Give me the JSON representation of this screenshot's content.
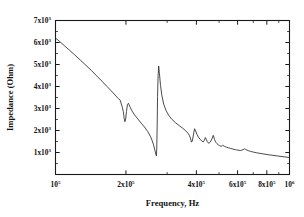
{
  "chart_data": {
    "type": "line",
    "title": "",
    "xlabel": "Frequency, Hz",
    "ylabel": "Impedance (Ohm)",
    "xscale": "log",
    "yscale": "linear",
    "xlim": [
      100000,
      1000000
    ],
    "ylim": [
      0,
      7000
    ],
    "grid": false,
    "legend": null,
    "xticks": [
      100000,
      200000,
      400000,
      600000,
      800000,
      1000000
    ],
    "xticklabels": [
      "10^5",
      "2x10^5",
      "4x10^5",
      "6x10^5",
      "8x10^5",
      "10^6"
    ],
    "yticks": [
      1000,
      2000,
      3000,
      4000,
      5000,
      6000,
      7000
    ],
    "yticklabels": [
      "1x10^3",
      "2x10^3",
      "3x10^3",
      "4x10^3",
      "5x10^3",
      "6x10^3",
      "7x10^3"
    ],
    "series": [
      {
        "name": "Impedance magnitude",
        "x": [
          100000,
          104000,
          109000,
          115000,
          121000,
          128000,
          135000,
          142000,
          150000,
          158000,
          166000,
          172000,
          178000,
          183000,
          186000,
          189000,
          191000,
          193000,
          195000,
          196500,
          198000,
          199500,
          201000,
          203000,
          205000,
          208000,
          212000,
          218000,
          225000,
          232000,
          240000,
          248000,
          256000,
          262000,
          266000,
          268500,
          270000,
          271000,
          272000,
          273000,
          274500,
          276000,
          278000,
          281000,
          285000,
          290000,
          297000,
          305000,
          315000,
          326000,
          338000,
          350000,
          360000,
          368000,
          374000,
          378000,
          381000,
          384000,
          387000,
          390000,
          393000,
          397000,
          402000,
          408000,
          415000,
          422000,
          428000,
          433000,
          437000,
          441000,
          445000,
          449000,
          453000,
          458000,
          463000,
          468000,
          472000,
          475000,
          478000,
          481000,
          485000,
          490000,
          496000,
          503000,
          510000,
          518000,
          527000,
          537000,
          548000,
          560000,
          573000,
          587000,
          602000,
          618000,
          632000,
          642000,
          650000,
          658000,
          668000,
          682000,
          700000,
          722000,
          748000,
          778000,
          812000,
          850000,
          892000,
          938000,
          1000000
        ],
        "y": [
          6200,
          6050,
          5860,
          5640,
          5430,
          5190,
          4960,
          4740,
          4480,
          4240,
          4000,
          3830,
          3660,
          3520,
          3440,
          3380,
          3210,
          3060,
          2850,
          2560,
          2400,
          2520,
          2860,
          3180,
          3240,
          3080,
          2900,
          2700,
          2520,
          2340,
          2160,
          1950,
          1680,
          1380,
          1100,
          920,
          850,
          1250,
          2300,
          3550,
          4500,
          4930,
          4600,
          4050,
          3580,
          3200,
          2900,
          2680,
          2500,
          2350,
          2220,
          2100,
          1990,
          1880,
          1760,
          1620,
          1470,
          1520,
          1700,
          1900,
          2080,
          1980,
          1830,
          1700,
          1600,
          1520,
          1480,
          1560,
          1680,
          1600,
          1500,
          1440,
          1420,
          1470,
          1560,
          1660,
          1780,
          1700,
          1600,
          1520,
          1460,
          1400,
          1350,
          1310,
          1275,
          1330,
          1280,
          1245,
          1215,
          1185,
          1155,
          1130,
          1105,
          1090,
          1125,
          1165,
          1140,
          1110,
          1080,
          1050,
          1020,
          990,
          960,
          930,
          900,
          870,
          840,
          810,
          770
        ]
      }
    ]
  },
  "axes": {
    "xlabel": "Frequency, Hz",
    "ylabel": "Impedance (Ohm)"
  }
}
